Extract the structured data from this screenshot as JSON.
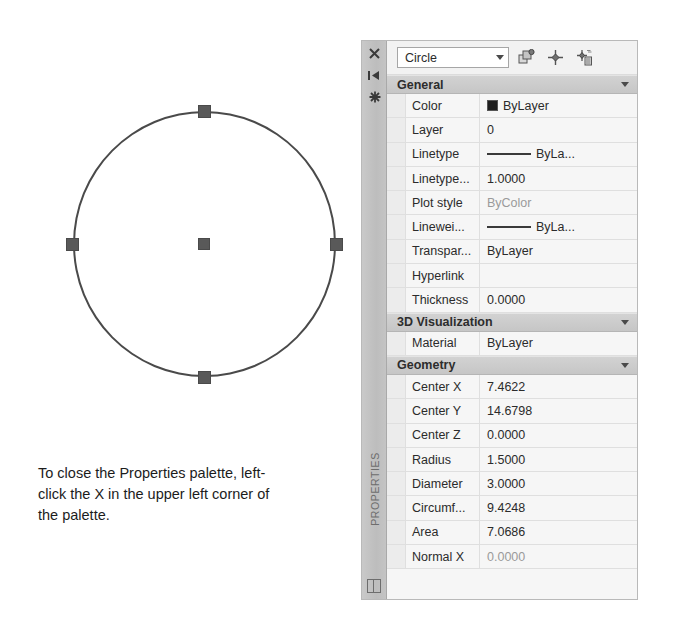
{
  "drawing": {
    "shape": "circle",
    "grips": [
      "center",
      "top-quadrant",
      "bottom-quadrant",
      "left-quadrant",
      "right-quadrant"
    ]
  },
  "caption": {
    "text": "To close the Properties palette, left-click the X in the upper left corner of the palette."
  },
  "palette": {
    "vertical_title": "PROPERTIES",
    "sidebar_icons": [
      {
        "name": "close-icon",
        "glyph": "✕"
      },
      {
        "name": "auto-hide-icon",
        "glyph": "▶|"
      },
      {
        "name": "palette-settings-icon",
        "glyph": "⚙"
      }
    ],
    "toolbar": {
      "object_type": "Circle",
      "buttons": [
        {
          "name": "toggle-pickadd-icon",
          "label": "PICKADD"
        },
        {
          "name": "select-objects-icon",
          "label": "Select Objects"
        },
        {
          "name": "quick-select-icon",
          "label": "Quick Select"
        }
      ]
    },
    "sections": [
      {
        "title": "General",
        "rows": [
          {
            "label": "Color",
            "value": "ByLayer",
            "swatch": "color",
            "grayed": false
          },
          {
            "label": "Layer",
            "value": "0",
            "swatch": "none",
            "grayed": false
          },
          {
            "label": "Linetype",
            "value": "ByLa...",
            "swatch": "line",
            "grayed": false
          },
          {
            "label": "Linetype...",
            "value": "1.0000",
            "swatch": "none",
            "grayed": false
          },
          {
            "label": "Plot style",
            "value": "ByColor",
            "swatch": "none",
            "grayed": true
          },
          {
            "label": "Linewei...",
            "value": "ByLa...",
            "swatch": "line",
            "grayed": false
          },
          {
            "label": "Transpar...",
            "value": "ByLayer",
            "swatch": "none",
            "grayed": false
          },
          {
            "label": "Hyperlink",
            "value": "",
            "swatch": "none",
            "grayed": false
          },
          {
            "label": "Thickness",
            "value": "0.0000",
            "swatch": "none",
            "grayed": false
          }
        ]
      },
      {
        "title": "3D Visualization",
        "rows": [
          {
            "label": "Material",
            "value": "ByLayer",
            "swatch": "none",
            "grayed": false
          }
        ]
      },
      {
        "title": "Geometry",
        "rows": [
          {
            "label": "Center X",
            "value": "7.4622",
            "swatch": "none",
            "grayed": false
          },
          {
            "label": "Center Y",
            "value": "14.6798",
            "swatch": "none",
            "grayed": false
          },
          {
            "label": "Center Z",
            "value": "0.0000",
            "swatch": "none",
            "grayed": false
          },
          {
            "label": "Radius",
            "value": "1.5000",
            "swatch": "none",
            "grayed": false
          },
          {
            "label": "Diameter",
            "value": "3.0000",
            "swatch": "none",
            "grayed": false
          },
          {
            "label": "Circumf...",
            "value": "9.4248",
            "swatch": "none",
            "grayed": false
          },
          {
            "label": "Area",
            "value": "7.0686",
            "swatch": "none",
            "grayed": false
          },
          {
            "label": "Normal X",
            "value": "0.0000",
            "swatch": "none",
            "grayed": true
          }
        ]
      }
    ]
  }
}
